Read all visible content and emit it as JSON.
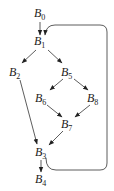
{
  "diagram": {
    "type": "control-flow-graph",
    "nodes": [
      {
        "id": "B0",
        "base": "B",
        "sub": "0",
        "x": 42,
        "y": 15
      },
      {
        "id": "B1",
        "base": "B",
        "sub": "1",
        "x": 42,
        "y": 42
      },
      {
        "id": "B2",
        "base": "B",
        "sub": "2",
        "x": 16,
        "y": 72
      },
      {
        "id": "B5",
        "base": "B",
        "sub": "5",
        "x": 68,
        "y": 72
      },
      {
        "id": "B6",
        "base": "B",
        "sub": "6",
        "x": 42,
        "y": 98
      },
      {
        "id": "B8",
        "base": "B",
        "sub": "8",
        "x": 94,
        "y": 98
      },
      {
        "id": "B7",
        "base": "B",
        "sub": "7",
        "x": 68,
        "y": 124
      },
      {
        "id": "B3",
        "base": "B",
        "sub": "3",
        "x": 42,
        "y": 153
      },
      {
        "id": "B4",
        "base": "B",
        "sub": "4",
        "x": 42,
        "y": 180
      }
    ],
    "edges": [
      {
        "from": "B0",
        "to": "B1"
      },
      {
        "from": "B1",
        "to": "B2"
      },
      {
        "from": "B1",
        "to": "B5"
      },
      {
        "from": "B5",
        "to": "B6"
      },
      {
        "from": "B5",
        "to": "B8"
      },
      {
        "from": "B6",
        "to": "B7"
      },
      {
        "from": "B8",
        "to": "B7"
      },
      {
        "from": "B7",
        "to": "B3"
      },
      {
        "from": "B2",
        "to": "B3"
      },
      {
        "from": "B3",
        "to": "B4"
      },
      {
        "from": "B3",
        "to": "B1",
        "kind": "back-edge"
      }
    ]
  }
}
